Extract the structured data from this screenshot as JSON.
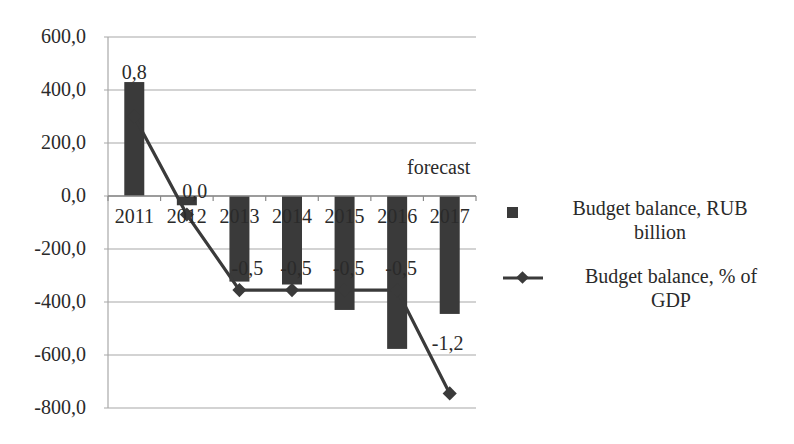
{
  "chart_data": {
    "type": "bar+line",
    "title": "",
    "xlabel": "",
    "ylabel": "",
    "categories": [
      "2011",
      "2012",
      "2013",
      "2014",
      "2015",
      "2016",
      "2017"
    ],
    "ylim": [
      -800,
      600
    ],
    "yticks": [
      "600,0",
      "400,0",
      "200,0",
      "0,0",
      "-200,0",
      "-400,0",
      "-600,0",
      "-800,0"
    ],
    "ytick_values": [
      600,
      400,
      200,
      0,
      -200,
      -400,
      -600,
      -800
    ],
    "grid": true,
    "legend_position": "right",
    "annotation": "forecast",
    "series": [
      {
        "name": "Budget balance, RUB billion",
        "type": "bar",
        "color": "#3a3a3a",
        "values": [
          430,
          -35,
          -323,
          -334,
          -430,
          -577,
          -445
        ]
      },
      {
        "name": "Budget balance, % of GDP",
        "type": "line",
        "marker": "diamond",
        "color": "#3a3a3a",
        "plotted_values": [
          300,
          -70,
          -355,
          -355,
          -355,
          -355,
          -745
        ],
        "data_labels": [
          "0,8",
          "0,0",
          "-0,5",
          "-0,5",
          "-0,5",
          "-0,5",
          "-1,2"
        ],
        "values": [
          0.8,
          0.0,
          -0.5,
          -0.5,
          -0.5,
          -0.5,
          -1.2
        ]
      }
    ]
  },
  "legend": {
    "bar_label_line1": "Budget balance, RUB",
    "bar_label_line2": "billion",
    "line_label_line1": "Budget balance, % of",
    "line_label_line2": "GDP"
  },
  "annotation": "forecast"
}
